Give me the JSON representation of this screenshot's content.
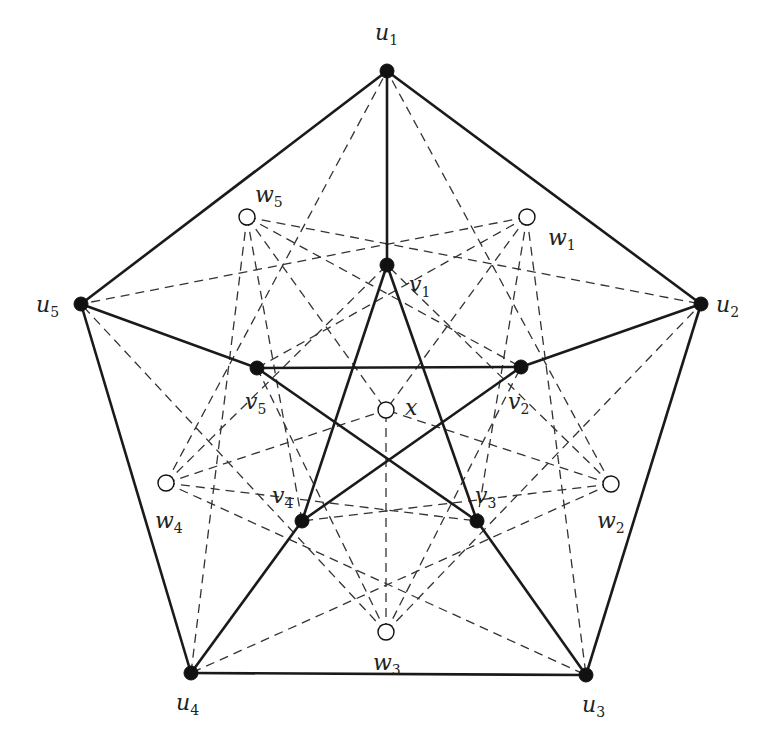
{
  "diagram": {
    "type": "graph",
    "vertices": [
      {
        "id": "u1",
        "name": "u",
        "sub": "1",
        "x": 387,
        "y": 71,
        "filled": true,
        "lx": 375,
        "ly": 40
      },
      {
        "id": "u2",
        "name": "u",
        "sub": "2",
        "x": 701,
        "y": 304,
        "filled": true,
        "lx": 716,
        "ly": 312
      },
      {
        "id": "u3",
        "name": "u",
        "sub": "3",
        "x": 586,
        "y": 675,
        "filled": true,
        "lx": 582,
        "ly": 712
      },
      {
        "id": "u4",
        "name": "u",
        "sub": "4",
        "x": 191,
        "y": 673,
        "filled": true,
        "lx": 176,
        "ly": 710
      },
      {
        "id": "u5",
        "name": "u",
        "sub": "5",
        "x": 81,
        "y": 304,
        "filled": true,
        "lx": 36,
        "ly": 312
      },
      {
        "id": "v1",
        "name": "v",
        "sub": "1",
        "x": 387,
        "y": 265,
        "filled": true,
        "lx": 409,
        "ly": 292
      },
      {
        "id": "v2",
        "name": "v",
        "sub": "2",
        "x": 521,
        "y": 367,
        "filled": true,
        "lx": 508,
        "ly": 409
      },
      {
        "id": "v3",
        "name": "v",
        "sub": "3",
        "x": 477,
        "y": 521,
        "filled": true,
        "lx": 475,
        "ly": 503
      },
      {
        "id": "v4",
        "name": "v",
        "sub": "4",
        "x": 302,
        "y": 521,
        "filled": true,
        "lx": 272,
        "ly": 503
      },
      {
        "id": "v5",
        "name": "v",
        "sub": "5",
        "x": 257,
        "y": 368,
        "filled": true,
        "lx": 245,
        "ly": 409
      },
      {
        "id": "w1",
        "name": "w",
        "sub": "1",
        "x": 527,
        "y": 217,
        "filled": false,
        "lx": 548,
        "ly": 245
      },
      {
        "id": "w2",
        "name": "w",
        "sub": "2",
        "x": 611,
        "y": 484,
        "filled": false,
        "lx": 597,
        "ly": 528
      },
      {
        "id": "w3",
        "name": "w",
        "sub": "3",
        "x": 386,
        "y": 632,
        "filled": false,
        "lx": 373,
        "ly": 670
      },
      {
        "id": "w4",
        "name": "w",
        "sub": "4",
        "x": 166,
        "y": 483,
        "filled": false,
        "lx": 155,
        "ly": 528
      },
      {
        "id": "w5",
        "name": "w",
        "sub": "5",
        "x": 247,
        "y": 217,
        "filled": false,
        "lx": 255,
        "ly": 202
      },
      {
        "id": "x",
        "name": "x",
        "sub": "",
        "x": 386,
        "y": 410,
        "filled": false,
        "lx": 405,
        "ly": 415
      }
    ],
    "solid_edges": [
      [
        "u1",
        "u2"
      ],
      [
        "u2",
        "u3"
      ],
      [
        "u3",
        "u4"
      ],
      [
        "u4",
        "u5"
      ],
      [
        "u5",
        "u1"
      ],
      [
        "u1",
        "v1"
      ],
      [
        "u2",
        "v2"
      ],
      [
        "u3",
        "v3"
      ],
      [
        "u4",
        "v4"
      ],
      [
        "u5",
        "v5"
      ],
      [
        "v1",
        "v3"
      ],
      [
        "v3",
        "v5"
      ],
      [
        "v5",
        "v2"
      ],
      [
        "v2",
        "v4"
      ],
      [
        "v4",
        "v1"
      ]
    ],
    "dashed_edges": [
      [
        "w1",
        "u5"
      ],
      [
        "w1",
        "v5"
      ],
      [
        "w1",
        "u3"
      ],
      [
        "w1",
        "v3"
      ],
      [
        "w1",
        "x"
      ],
      [
        "w2",
        "u1"
      ],
      [
        "w2",
        "v1"
      ],
      [
        "w2",
        "u4"
      ],
      [
        "w2",
        "v4"
      ],
      [
        "w2",
        "x"
      ],
      [
        "w3",
        "u2"
      ],
      [
        "w3",
        "v2"
      ],
      [
        "w3",
        "u5"
      ],
      [
        "w3",
        "v5"
      ],
      [
        "w3",
        "x"
      ],
      [
        "w4",
        "u3"
      ],
      [
        "w4",
        "v3"
      ],
      [
        "w4",
        "u1"
      ],
      [
        "w4",
        "v1"
      ],
      [
        "w4",
        "x"
      ],
      [
        "w5",
        "u4"
      ],
      [
        "w5",
        "v4"
      ],
      [
        "w5",
        "u2"
      ],
      [
        "w5",
        "v2"
      ],
      [
        "w5",
        "x"
      ]
    ],
    "colors": {
      "edge": "#1a1a1a",
      "dashed": "#333333",
      "filled_vertex": "#111111",
      "open_vertex_fill": "#ffffff"
    }
  }
}
